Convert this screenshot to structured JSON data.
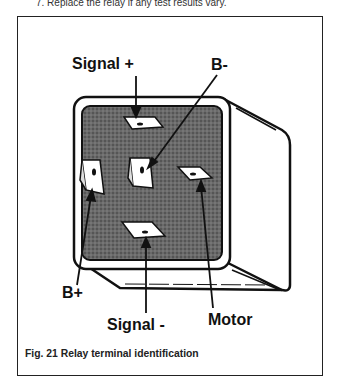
{
  "page": {
    "preceding_text": "7. Replace the relay if any test results vary."
  },
  "figure": {
    "caption": "Fig. 21  Relay terminal identification",
    "labels": {
      "signal_plus": "Signal +",
      "b_minus": "B-",
      "b_plus": "B+",
      "signal_minus": "Signal -",
      "motor": "Motor"
    },
    "colors": {
      "line": "#111111",
      "fill_dark": "#555555",
      "background": "#ffffff"
    }
  }
}
